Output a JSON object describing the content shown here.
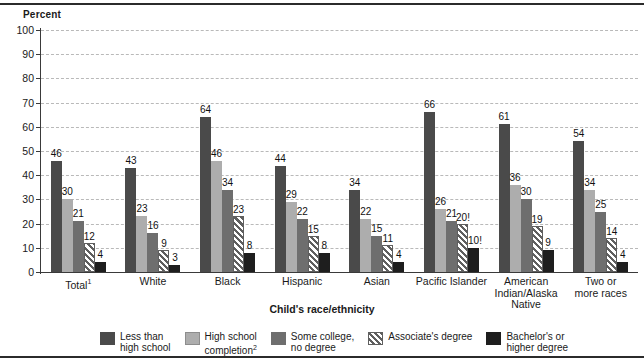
{
  "chart_data": {
    "type": "bar",
    "title": "",
    "ylabel": "Percent",
    "xlabel": "Child's race/ethnicity",
    "ylim": [
      0,
      100
    ],
    "yticks": [
      0,
      10,
      20,
      30,
      40,
      50,
      60,
      70,
      80,
      90,
      100
    ],
    "grid": true,
    "legend_position": "bottom",
    "categories": [
      "Total¹",
      "White",
      "Black",
      "Hispanic",
      "Asian",
      "Pacific Islander",
      "American Indian/Alaska Native",
      "Two or more races"
    ],
    "category_lines": [
      [
        "Total¹"
      ],
      [
        "White"
      ],
      [
        "Black"
      ],
      [
        "Hispanic"
      ],
      [
        "Asian"
      ],
      [
        "Pacific Islander"
      ],
      [
        "American",
        "Indian/Alaska",
        "Native"
      ],
      [
        "Two or",
        "more races"
      ]
    ],
    "series": [
      {
        "name": "Less than high school",
        "legend_lines": [
          "Less than",
          "high school"
        ],
        "color": "#4a4a4a",
        "values": [
          46,
          43,
          64,
          44,
          34,
          66,
          61,
          54
        ],
        "labels": [
          "46",
          "43",
          "64",
          "44",
          "34",
          "66",
          "61",
          "54"
        ]
      },
      {
        "name": "High school completion²",
        "legend_lines": [
          "High school",
          "completion²"
        ],
        "color": "#adadad",
        "values": [
          30,
          23,
          46,
          29,
          22,
          26,
          36,
          34
        ],
        "labels": [
          "30",
          "23",
          "46",
          "29",
          "22",
          "26",
          "36",
          "34"
        ]
      },
      {
        "name": "Some college, no degree",
        "legend_lines": [
          "Some college,",
          "no degree"
        ],
        "color": "#6e6e6e",
        "values": [
          21,
          16,
          34,
          22,
          15,
          21,
          30,
          25
        ],
        "labels": [
          "21",
          "16",
          "34",
          "22",
          "15",
          "21",
          "30",
          "25"
        ]
      },
      {
        "name": "Associate's degree",
        "legend_lines": [
          "Associate's degree"
        ],
        "color": "#5f5f5f-hatch",
        "values": [
          12,
          9,
          23,
          15,
          11,
          20,
          19,
          14
        ],
        "labels": [
          "12",
          "9",
          "23",
          "15",
          "11",
          "20!",
          "19",
          "14"
        ]
      },
      {
        "name": "Bachelor's or higher degree",
        "legend_lines": [
          "Bachelor's or",
          "higher degree"
        ],
        "color": "#1e1e1e",
        "values": [
          4,
          3,
          8,
          8,
          4,
          10,
          9,
          4
        ],
        "labels": [
          "4",
          "3",
          "8",
          "8",
          "4",
          "10!",
          "9",
          "4"
        ]
      }
    ]
  }
}
